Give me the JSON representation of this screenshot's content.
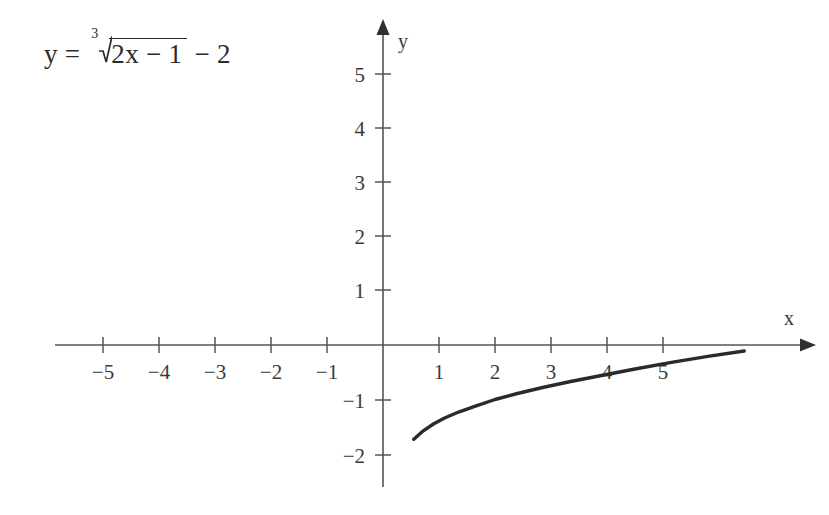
{
  "figure": {
    "title": "",
    "equation": {
      "lhs": "y",
      "equals": "=",
      "root_index": "3",
      "radicand": "2x − 1",
      "tail": "− 2",
      "plain": "y = ∛(2x − 1) − 2"
    },
    "axes": {
      "x_label": "x",
      "y_label": "y",
      "x_tick_labels": [
        "−5",
        "−4",
        "−3",
        "−2",
        "−1",
        "1",
        "2",
        "3",
        "4",
        "5"
      ],
      "y_tick_labels": [
        "5",
        "4",
        "3",
        "2",
        "1",
        "−1",
        "−2"
      ],
      "axis_color": "#555555",
      "curve_color": "#2a2a2a",
      "background": "#ffffff"
    }
  },
  "chart_data": {
    "type": "line",
    "title": "",
    "xlabel": "x",
    "ylabel": "y",
    "xlim": [
      -5.9,
      7.5
    ],
    "ylim": [
      -2.55,
      5.6
    ],
    "grid": false,
    "legend": null,
    "xticks": [
      -5,
      -4,
      -3,
      -2,
      -1,
      1,
      2,
      3,
      4,
      5
    ],
    "yticks": [
      5,
      4,
      3,
      2,
      1,
      -1,
      -2
    ],
    "series": [
      {
        "name": "y = cbrt(2x - 1) - 2",
        "equation": "y = (2x - 1)^(1/3) - 2",
        "x_start": 0.55,
        "x_end": 6.45,
        "x_intercept": 4.5,
        "points": [
          [
            0.55,
            -1.73
          ],
          [
            0.7,
            -1.59
          ],
          [
            0.9,
            -1.45
          ],
          [
            1.1,
            -1.34
          ],
          [
            1.35,
            -1.23
          ],
          [
            1.65,
            -1.12
          ],
          [
            2.0,
            -1.0
          ],
          [
            2.4,
            -0.89
          ],
          [
            2.85,
            -0.78
          ],
          [
            3.35,
            -0.67
          ],
          [
            3.9,
            -0.56
          ],
          [
            4.5,
            -0.44
          ],
          [
            5.15,
            -0.32
          ],
          [
            5.8,
            -0.21
          ],
          [
            6.45,
            -0.11
          ]
        ]
      }
    ]
  }
}
